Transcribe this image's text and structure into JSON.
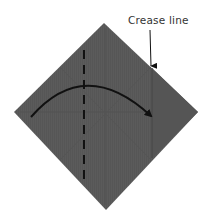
{
  "diagram": {
    "type": "origami-fold-step",
    "annotation": {
      "label": "Crease line"
    },
    "colors": {
      "paper": "#5b5b5b",
      "paper_dark": "#4f4f4f",
      "crease_shade": "#525252",
      "ink": "#111111",
      "label_text": "#333333",
      "background": "#ffffff"
    },
    "paper": {
      "shape": "square-rotated-45",
      "vertices": {
        "top": [
          104,
          23
        ],
        "right": [
          198,
          112
        ],
        "bottom": [
          106,
          210
        ],
        "left": [
          14,
          112
        ]
      }
    },
    "valley_fold_line": {
      "style": "dashed",
      "x": 84,
      "y1": 50,
      "y2": 185
    },
    "fold_arrow": {
      "start": [
        31,
        117
      ],
      "control": [
        85,
        60
      ],
      "end": [
        153,
        118
      ]
    },
    "crease_line": {
      "x": 152,
      "y1": 68,
      "y2": 158
    },
    "pointer_arrow": {
      "from": [
        150,
        30
      ],
      "to": [
        151,
        68
      ]
    }
  }
}
